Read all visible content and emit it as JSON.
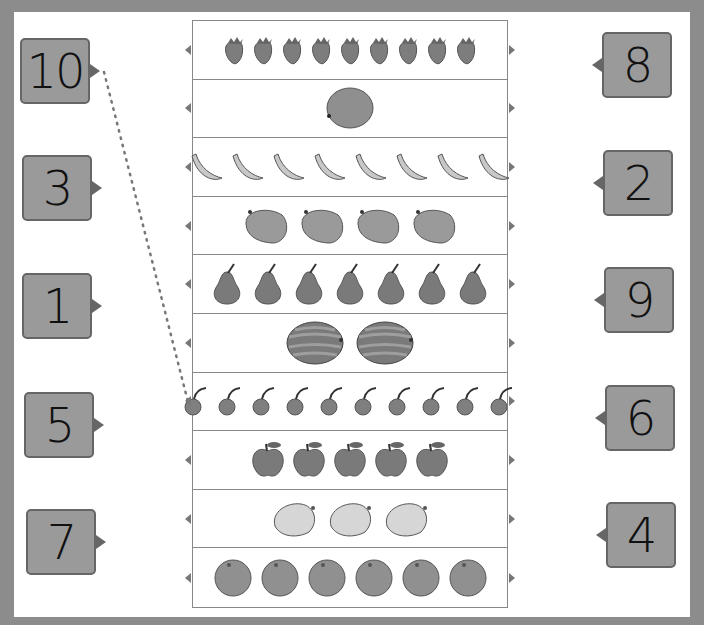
{
  "worksheet": {
    "instruction_line": {
      "from_number": "10",
      "to_row": 7,
      "style": "dotted"
    },
    "left_numbers": [
      "10",
      "3",
      "1",
      "5",
      "7"
    ],
    "right_numbers": [
      "8",
      "2",
      "9",
      "6",
      "4"
    ],
    "rows": [
      {
        "fruit": "strawberry",
        "count": 9
      },
      {
        "fruit": "melon",
        "count": 1
      },
      {
        "fruit": "banana",
        "count": 8
      },
      {
        "fruit": "mango",
        "count": 4
      },
      {
        "fruit": "pear",
        "count": 7
      },
      {
        "fruit": "watermelon",
        "count": 2
      },
      {
        "fruit": "cherry",
        "count": 10
      },
      {
        "fruit": "apple",
        "count": 5
      },
      {
        "fruit": "lemon",
        "count": 3
      },
      {
        "fruit": "orange",
        "count": 6
      }
    ]
  },
  "colors": {
    "frame": "#8c8c8c",
    "box": "#9a9a9a",
    "box_border": "#666666",
    "fruit": "#888888"
  }
}
